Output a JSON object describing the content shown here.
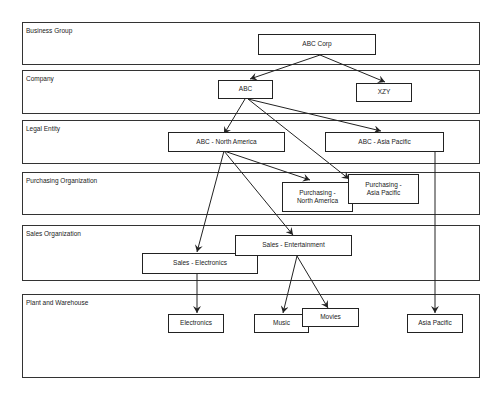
{
  "lanes": [
    {
      "id": "business-group",
      "label": "Business Group"
    },
    {
      "id": "company",
      "label": "Company"
    },
    {
      "id": "legal-entity",
      "label": "Legal Entity"
    },
    {
      "id": "purchasing-organization",
      "label": "Purchasing Organization"
    },
    {
      "id": "sales-organization",
      "label": "Sales Organization"
    },
    {
      "id": "plant-and-warehouse",
      "label": "Plant and Warehouse"
    }
  ],
  "nodes": {
    "abc_corp": "ABC Corp",
    "abc": "ABC",
    "xzy": "XZY",
    "abc_north_america": "ABC - North America",
    "abc_asia_pacific": "ABC - Asia Pacific",
    "purchasing_north_america": "Purchasing -\nNorth America",
    "purchasing_asia_pacific": "Purchasing -\nAsia Pacific",
    "sales_entertainment": "Sales - Entertainment",
    "sales_electronics": "Sales - Electronics",
    "electronics": "Electronics",
    "music": "Music",
    "movies": "Movies",
    "asia_pacific": "Asia Pacific"
  },
  "edges": [
    {
      "from": "ABC Corp",
      "to": "ABC"
    },
    {
      "from": "ABC Corp",
      "to": "XZY"
    },
    {
      "from": "ABC",
      "to": "ABC - North America"
    },
    {
      "from": "ABC",
      "to": "ABC - Asia Pacific"
    },
    {
      "from": "ABC",
      "to": "Purchasing - Asia Pacific"
    },
    {
      "from": "ABC - North America",
      "to": "Purchasing - North America"
    },
    {
      "from": "ABC - North America",
      "to": "Sales - Electronics"
    },
    {
      "from": "ABC - North America",
      "to": "Sales - Entertainment"
    },
    {
      "from": "ABC - Asia Pacific",
      "to": "Asia Pacific"
    },
    {
      "from": "Sales - Electronics",
      "to": "Electronics"
    },
    {
      "from": "Sales - Entertainment",
      "to": "Music"
    },
    {
      "from": "Sales - Entertainment",
      "to": "Movies"
    }
  ]
}
